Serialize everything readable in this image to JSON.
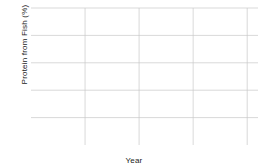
{
  "chart_data": {
    "type": "line",
    "title": "",
    "xlabel": "Year",
    "ylabel": "Protein from Fish (%)",
    "xlim": [
      1960,
      2002
    ],
    "ylim": [
      3,
      8
    ],
    "xticks": [
      1960,
      1970,
      1980,
      1990,
      2000
    ],
    "yticks": [
      3,
      4,
      5,
      6,
      7,
      8
    ],
    "grid": true,
    "legend_position": "center",
    "x": [
      1960,
      1961,
      1962,
      1963,
      1964,
      1965,
      1966,
      1967,
      1968,
      1969,
      1970,
      1971,
      1972,
      1973,
      1974,
      1975,
      1976,
      1977,
      1978,
      1979,
      1980,
      1981,
      1982,
      1983,
      1984,
      1985,
      1986,
      1987,
      1988,
      1989,
      1990,
      1991,
      1992,
      1993,
      1994,
      1995,
      1996,
      1997,
      1998,
      1999,
      2000,
      2001,
      2002
    ],
    "series": [
      {
        "name": "Developed",
        "color": "#58585a",
        "values": [
          6.08,
          6.02,
          6.0,
          6.04,
          5.76,
          6.12,
          6.33,
          6.36,
          6.36,
          6.69,
          6.44,
          6.48,
          6.62,
          6.72,
          6.86,
          7.12,
          7.02,
          7.35,
          7.0,
          7.08,
          6.98,
          7.14,
          7.15,
          7.14,
          7.3,
          7.45,
          7.62,
          7.78,
          7.92,
          8.0,
          7.92,
          7.48,
          6.98,
          6.7,
          6.9,
          6.95,
          6.95,
          6.95,
          6.92,
          6.98,
          7.0,
          6.88,
          6.9
        ]
      },
      {
        "name": "Developing",
        "color": "#8c8c8e",
        "values": [
          4.26,
          4.36,
          4.44,
          4.52,
          4.7,
          4.54,
          4.72,
          4.86,
          5.02,
          4.86,
          5.02,
          5.14,
          5.22,
          5.28,
          5.34,
          5.44,
          5.28,
          5.22,
          5.2,
          5.14,
          5.1,
          5.12,
          5.1,
          5.1,
          5.12,
          5.24,
          5.36,
          5.44,
          5.52,
          5.58,
          5.62,
          5.52,
          5.34,
          5.24,
          5.34,
          5.46,
          5.62,
          5.78,
          5.84,
          5.88,
          5.98,
          6.0,
          5.84
        ]
      },
      {
        "name": "World",
        "color": "#a6a6a8",
        "values": [
          3.05,
          3.2,
          3.36,
          3.5,
          3.62,
          3.7,
          3.74,
          3.84,
          3.94,
          3.76,
          3.82,
          3.92,
          4.02,
          4.12,
          4.16,
          4.14,
          4.06,
          3.92,
          4.0,
          3.86,
          3.92,
          3.96,
          3.96,
          3.95,
          3.94,
          4.1,
          4.22,
          4.36,
          4.48,
          4.42,
          4.56,
          4.72,
          4.9,
          5.06,
          5.22,
          5.36,
          5.46,
          5.52,
          5.56,
          5.58,
          5.64,
          5.68,
          5.62
        ]
      }
    ]
  },
  "axes": {
    "xticklabels": [
      "1960",
      "1970",
      "1980",
      "1990",
      "2000"
    ],
    "yticklabels": [
      "3",
      "4",
      "5",
      "6",
      "7",
      "8"
    ]
  },
  "legend": {
    "items": [
      {
        "label": "Developed"
      },
      {
        "label": "Developing"
      },
      {
        "label": "World"
      }
    ]
  }
}
